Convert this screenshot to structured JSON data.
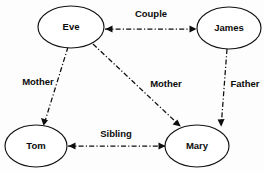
{
  "diagram": {
    "background_color": "#fdfdfd",
    "stroke_color": "#0d0d0d",
    "node_fill_color": "#ffffff",
    "edge_style": "dash-dot",
    "nodes": [
      {
        "id": "eve",
        "label": "Eve",
        "cx": 71,
        "cy": 27,
        "rx": 33,
        "ry": 21
      },
      {
        "id": "james",
        "label": "James",
        "cx": 229,
        "cy": 28,
        "rx": 32,
        "ry": 21
      },
      {
        "id": "tom",
        "label": "Tom",
        "cx": 36,
        "cy": 146,
        "rx": 31,
        "ry": 21
      },
      {
        "id": "mary",
        "label": "Mary",
        "cx": 197,
        "cy": 146,
        "rx": 32,
        "ry": 21
      }
    ],
    "edges": [
      {
        "id": "couple",
        "label": "Couple",
        "from": "eve",
        "to": "james",
        "direction": "bidirectional",
        "label_x": 151,
        "label_y": 14,
        "x1": 105,
        "y1": 29,
        "x2": 196,
        "y2": 29
      },
      {
        "id": "mother-tom",
        "label": "Mother",
        "from": "eve",
        "to": "tom",
        "direction": "unidirectional",
        "label_x": 38,
        "label_y": 82,
        "x1": 68,
        "y1": 47,
        "x2": 44,
        "y2": 124
      },
      {
        "id": "mother-mary",
        "label": "Mother",
        "from": "eve",
        "to": "mary",
        "direction": "unidirectional",
        "label_x": 166,
        "label_y": 84,
        "x1": 93,
        "y1": 44,
        "x2": 180,
        "y2": 126
      },
      {
        "id": "father-mary",
        "label": "Father",
        "from": "james",
        "to": "mary",
        "direction": "unidirectional",
        "label_x": 245,
        "label_y": 84,
        "x1": 227,
        "y1": 49,
        "x2": 221,
        "y2": 125
      },
      {
        "id": "sibling",
        "label": "Sibling",
        "from": "tom",
        "to": "mary",
        "direction": "bidirectional",
        "label_x": 116,
        "label_y": 134,
        "x1": 68,
        "y1": 146,
        "x2": 165,
        "y2": 146
      }
    ]
  }
}
